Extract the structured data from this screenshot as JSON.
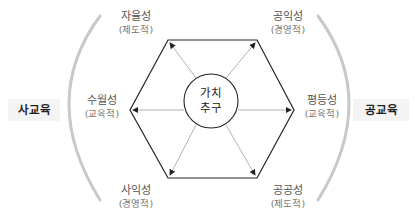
{
  "diagram": {
    "left_sector": "사교육",
    "right_sector": "공교육",
    "center": {
      "line1": "가치",
      "line2": "추구"
    },
    "nodes": [
      {
        "id": "top-left",
        "main": "자율성",
        "sub": "(제도적)"
      },
      {
        "id": "top-right",
        "main": "공익성",
        "sub": "(경영적)"
      },
      {
        "id": "left",
        "main": "수월성",
        "sub": "(교육적)"
      },
      {
        "id": "right",
        "main": "평등성",
        "sub": "(교육적)"
      },
      {
        "id": "bottom-left",
        "main": "사익성",
        "sub": "(경영적)"
      },
      {
        "id": "bottom-right",
        "main": "공공성",
        "sub": "(제도적)"
      }
    ],
    "colors": {
      "hexagon": "#222222",
      "arrows": "#aaaaaa",
      "arcs": "#c8c8c8",
      "side_box_bg": "#f4f4f4"
    }
  }
}
